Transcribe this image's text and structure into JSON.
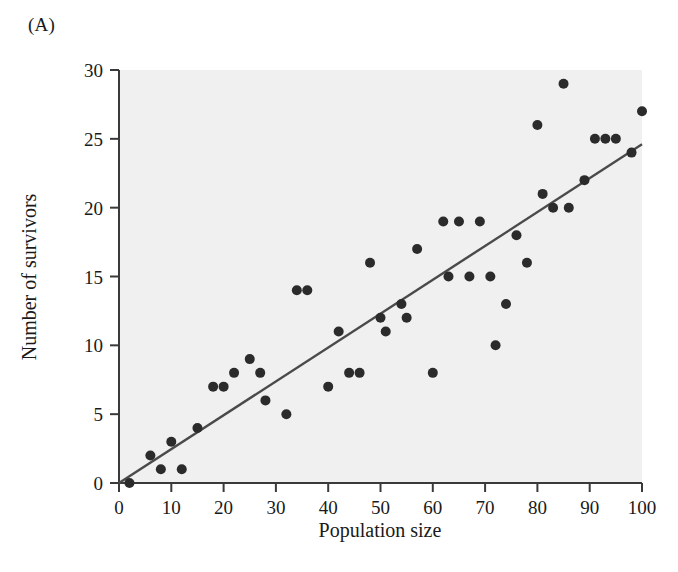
{
  "figure": {
    "panel_label": "(A)",
    "plot_background": "#f0f0f0",
    "axis_color": "#3a3a3a",
    "marker_color": "#2b2b2b",
    "regression_line_color": "#4a4a4a"
  },
  "chart_data": {
    "type": "scatter",
    "title": "",
    "xlabel": "Population size",
    "ylabel": "Number of survivors",
    "xlim": [
      0,
      100
    ],
    "ylim": [
      0,
      30
    ],
    "xticks": [
      0,
      10,
      20,
      30,
      40,
      50,
      60,
      70,
      80,
      90,
      100
    ],
    "yticks": [
      0,
      5,
      10,
      15,
      20,
      25,
      30
    ],
    "xtick_labels": [
      "0",
      "10",
      "20",
      "30",
      "40",
      "50",
      "60",
      "70",
      "80",
      "90",
      "100"
    ],
    "ytick_labels": [
      "0",
      "5",
      "10",
      "15",
      "20",
      "25",
      "30"
    ],
    "grid": false,
    "legend": null,
    "marker_radius": 5,
    "points": [
      {
        "x": 2,
        "y": 0
      },
      {
        "x": 6,
        "y": 2
      },
      {
        "x": 8,
        "y": 1
      },
      {
        "x": 10,
        "y": 3
      },
      {
        "x": 12,
        "y": 1
      },
      {
        "x": 15,
        "y": 4
      },
      {
        "x": 18,
        "y": 7
      },
      {
        "x": 20,
        "y": 7
      },
      {
        "x": 22,
        "y": 8
      },
      {
        "x": 25,
        "y": 9
      },
      {
        "x": 27,
        "y": 8
      },
      {
        "x": 28,
        "y": 6
      },
      {
        "x": 32,
        "y": 5
      },
      {
        "x": 34,
        "y": 14
      },
      {
        "x": 36,
        "y": 14
      },
      {
        "x": 40,
        "y": 7
      },
      {
        "x": 42,
        "y": 11
      },
      {
        "x": 44,
        "y": 8
      },
      {
        "x": 46,
        "y": 8
      },
      {
        "x": 48,
        "y": 16
      },
      {
        "x": 50,
        "y": 12
      },
      {
        "x": 51,
        "y": 11
      },
      {
        "x": 54,
        "y": 13
      },
      {
        "x": 55,
        "y": 12
      },
      {
        "x": 57,
        "y": 17
      },
      {
        "x": 60,
        "y": 8
      },
      {
        "x": 62,
        "y": 19
      },
      {
        "x": 63,
        "y": 15
      },
      {
        "x": 65,
        "y": 19
      },
      {
        "x": 67,
        "y": 15
      },
      {
        "x": 69,
        "y": 19
      },
      {
        "x": 71,
        "y": 15
      },
      {
        "x": 72,
        "y": 10
      },
      {
        "x": 74,
        "y": 13
      },
      {
        "x": 76,
        "y": 18
      },
      {
        "x": 78,
        "y": 16
      },
      {
        "x": 80,
        "y": 26
      },
      {
        "x": 81,
        "y": 21
      },
      {
        "x": 83,
        "y": 20
      },
      {
        "x": 85,
        "y": 29
      },
      {
        "x": 86,
        "y": 20
      },
      {
        "x": 89,
        "y": 22
      },
      {
        "x": 91,
        "y": 25
      },
      {
        "x": 93,
        "y": 25
      },
      {
        "x": 95,
        "y": 25
      },
      {
        "x": 98,
        "y": 24
      },
      {
        "x": 100,
        "y": 27
      }
    ],
    "regression_line": {
      "x0": 0,
      "y0": 0,
      "x1": 100,
      "y1": 24.6
    }
  }
}
